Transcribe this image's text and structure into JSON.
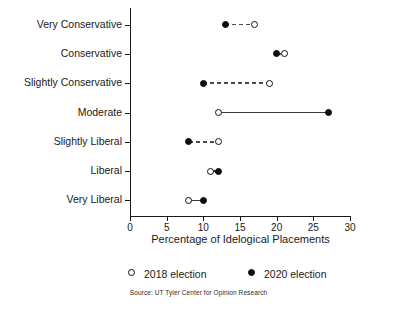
{
  "chart_data": {
    "type": "scatter",
    "subtype": "dumbbell",
    "title": "",
    "xlabel": "Percentage of Idelogical Placements",
    "ylabel": "",
    "xlim": [
      0,
      30
    ],
    "xticks": [
      0,
      5,
      10,
      15,
      20,
      25,
      30
    ],
    "xticklabels": [
      "0",
      "5",
      "10",
      "15",
      "20",
      "25",
      "30"
    ],
    "grid": false,
    "legend_position": "below-axis",
    "categories": [
      "Very Conservative",
      "Conservative",
      "Slightly Conservative",
      "Moderate",
      "Slightly Liberal",
      "Liberal",
      "Very Liberal"
    ],
    "series": [
      {
        "name": "2018 election",
        "marker": "open-circle",
        "color": "#111111",
        "values": [
          17,
          21,
          19,
          12,
          12,
          11,
          8
        ]
      },
      {
        "name": "2020 election",
        "marker": "filled-circle",
        "color": "#0d0d0d",
        "values": [
          13,
          20,
          10,
          27,
          8,
          12,
          10
        ]
      }
    ],
    "rows": [
      {
        "category": "Very Conservative",
        "v2018": 17,
        "v2020": 13,
        "connector": "dashed"
      },
      {
        "category": "Conservative",
        "v2018": 21,
        "v2020": 20,
        "connector": "dashed"
      },
      {
        "category": "Slightly Conservative",
        "v2018": 19,
        "v2020": 10,
        "connector": "dashed"
      },
      {
        "category": "Moderate",
        "v2018": 12,
        "v2020": 27,
        "connector": "solid"
      },
      {
        "category": "Slightly Liberal",
        "v2018": 12,
        "v2020": 8,
        "connector": "dashed"
      },
      {
        "category": "Liberal",
        "v2018": 11,
        "v2020": 12,
        "connector": "solid"
      },
      {
        "category": "Very Liberal",
        "v2018": 8,
        "v2020": 10,
        "connector": "solid"
      }
    ]
  },
  "legend": {
    "entries": [
      {
        "label": "2018 election",
        "marker": "open-circle"
      },
      {
        "label": "2020 election",
        "marker": "filled-circle"
      }
    ]
  },
  "source": {
    "text": "Source: UT Tyler Center for Opinion Research"
  }
}
